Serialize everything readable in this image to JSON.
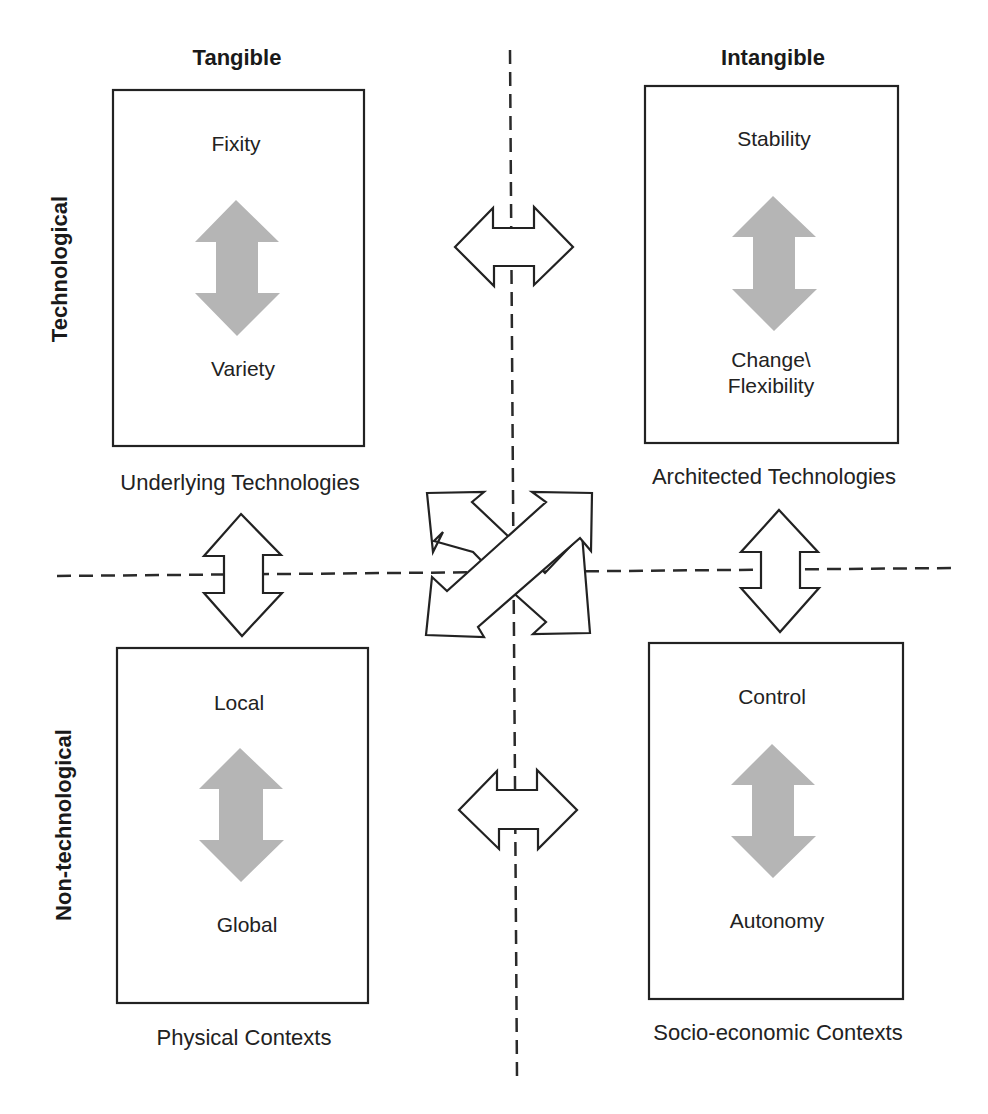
{
  "column_headers": {
    "left": "Tangible",
    "right": "Intangible"
  },
  "row_headers": {
    "top": "Technological",
    "bottom": "Non-technological"
  },
  "quadrants": [
    {
      "id": "top-left",
      "top_label": "Fixity",
      "bottom_label": "Variety",
      "caption": "Underlying Technologies"
    },
    {
      "id": "top-right",
      "top_label": "Stability",
      "bottom_label": "Change\\\nFlexibility",
      "bottom_label_line1": "Change\\",
      "bottom_label_line2": "Flexibility",
      "caption": "Architected Technologies"
    },
    {
      "id": "bottom-left",
      "top_label": "Local",
      "bottom_label": "Global",
      "caption": "Physical Contexts"
    },
    {
      "id": "bottom-right",
      "top_label": "Control",
      "bottom_label": "Autonomy",
      "caption": "Socio-economic Contexts"
    }
  ],
  "connectors": [
    {
      "name": "top-horizontal",
      "type": "double-arrow",
      "orientation": "horizontal",
      "connects": [
        "top-left",
        "top-right"
      ]
    },
    {
      "name": "bottom-horizontal",
      "type": "double-arrow",
      "orientation": "horizontal",
      "connects": [
        "bottom-left",
        "bottom-right"
      ]
    },
    {
      "name": "left-vertical",
      "type": "double-arrow",
      "orientation": "vertical",
      "connects": [
        "top-left",
        "bottom-left"
      ]
    },
    {
      "name": "right-vertical",
      "type": "double-arrow",
      "orientation": "vertical",
      "connects": [
        "top-right",
        "bottom-right"
      ]
    },
    {
      "name": "center-diagonal",
      "type": "crossed-double-arrows",
      "orientation": "diagonal",
      "connects": [
        "top-left",
        "bottom-right",
        "top-right",
        "bottom-left"
      ]
    }
  ],
  "colors": {
    "line": "#222222",
    "inner_arrow": "#b3b3b3",
    "background": "#ffffff"
  }
}
